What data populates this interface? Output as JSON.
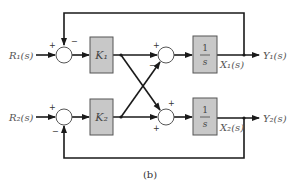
{
  "diagram": {
    "caption": "(b)",
    "inputs": [
      {
        "label": "R₁(s)"
      },
      {
        "label": "R₂(s)"
      }
    ],
    "outputs": [
      {
        "label": "Y₁(s)"
      },
      {
        "label": "Y₂(s)"
      }
    ],
    "states": [
      {
        "label": "X₁(s)"
      },
      {
        "label": "X₂(s)"
      }
    ],
    "gain_blocks": [
      {
        "label": "K₁"
      },
      {
        "label": "K₂"
      }
    ],
    "integrator_blocks": [
      {
        "numerator": "1",
        "denominator": "s"
      },
      {
        "numerator": "1",
        "denominator": "s"
      }
    ],
    "summing_junctions": [
      {
        "id": "sum-input-1",
        "signs": {
          "left": "+",
          "top": "−"
        }
      },
      {
        "id": "sum-cross-1",
        "signs": {
          "left": "+",
          "bottom": "−"
        }
      },
      {
        "id": "sum-input-2",
        "signs": {
          "left": "+",
          "bottom": "−"
        }
      },
      {
        "id": "sum-cross-2",
        "signs": {
          "top": "+",
          "left": "+"
        }
      }
    ],
    "colors": {
      "block_fill": "#c8c8c8",
      "wire": "#1a1a1a",
      "text": "#555555"
    }
  }
}
